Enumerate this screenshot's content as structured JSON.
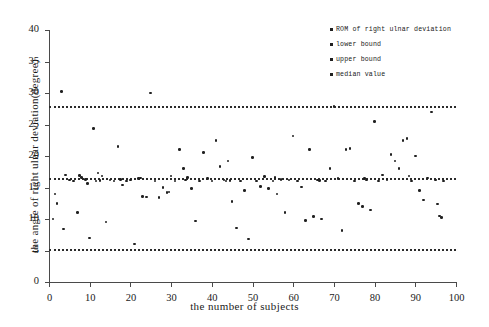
{
  "chart_data": {
    "type": "scatter",
    "title": "",
    "xlabel": "the number of subjects",
    "ylabel": "the angle of right ulnar deviation(degree)",
    "xlim": [
      0,
      100
    ],
    "ylim": [
      0,
      40
    ],
    "xticks": [
      0,
      10,
      20,
      30,
      40,
      50,
      60,
      70,
      80,
      90,
      100
    ],
    "yticks": [
      0,
      5,
      10,
      15,
      20,
      25,
      30,
      35,
      40
    ],
    "grid": false,
    "legend_position": "top-right",
    "legend": [
      {
        "label": "ROM of right ulnar deviation",
        "marker": "dot"
      },
      {
        "label": "lower bound",
        "marker": "dot"
      },
      {
        "label": "upper bound",
        "marker": "dot"
      },
      {
        "label": "median value",
        "marker": "dot"
      }
    ],
    "reference_lines": [
      {
        "name": "upper bound",
        "value": 28.0,
        "style": "dotted"
      },
      {
        "name": "median value",
        "value": 16.5,
        "style": "dotted"
      },
      {
        "name": "lower bound",
        "value": 5.2,
        "style": "dotted"
      }
    ],
    "series": [
      {
        "name": "ROM of right ulnar deviation",
        "marker": "dot",
        "color": "#202020",
        "points": [
          [
            1,
            10.0
          ],
          [
            1.5,
            14.0
          ],
          [
            2,
            12.5
          ],
          [
            3,
            30.2
          ],
          [
            3.5,
            8.4
          ],
          [
            4,
            17.0
          ],
          [
            5,
            16.2
          ],
          [
            6,
            16.0
          ],
          [
            7,
            11.0
          ],
          [
            8,
            16.6
          ],
          [
            9,
            16.3
          ],
          [
            9.5,
            15.6
          ],
          [
            10,
            7.0
          ],
          [
            11,
            24.4
          ],
          [
            11.5,
            16.0
          ],
          [
            12,
            17.3
          ],
          [
            13,
            16.8
          ],
          [
            14,
            9.5
          ],
          [
            15,
            16.2
          ],
          [
            16,
            16.0
          ],
          [
            17,
            21.5
          ],
          [
            17.5,
            16.3
          ],
          [
            18,
            15.4
          ],
          [
            19,
            16.0
          ],
          [
            20,
            16.2
          ],
          [
            21,
            6.0
          ],
          [
            22,
            16.4
          ],
          [
            23,
            13.6
          ],
          [
            24,
            13.5
          ],
          [
            25,
            30.0
          ],
          [
            26,
            16.0
          ],
          [
            27,
            13.4
          ],
          [
            28,
            15.0
          ],
          [
            29,
            14.2
          ],
          [
            29.5,
            14.3
          ],
          [
            30,
            16.8
          ],
          [
            31,
            16.0
          ],
          [
            32,
            21.0
          ],
          [
            33,
            18.0
          ],
          [
            34,
            16.6
          ],
          [
            35,
            14.8
          ],
          [
            36,
            9.7
          ],
          [
            37,
            16.0
          ],
          [
            38,
            20.6
          ],
          [
            39,
            16.4
          ],
          [
            40,
            16.0
          ],
          [
            41,
            22.5
          ],
          [
            42,
            18.3
          ],
          [
            43,
            16.2
          ],
          [
            43.5,
            16.0
          ],
          [
            44,
            19.2
          ],
          [
            45,
            12.8
          ],
          [
            46,
            8.6
          ],
          [
            47,
            16.0
          ],
          [
            48,
            14.5
          ],
          [
            49,
            6.8
          ],
          [
            50,
            19.8
          ],
          [
            51,
            16.0
          ],
          [
            52,
            15.2
          ],
          [
            53,
            16.7
          ],
          [
            54,
            14.8
          ],
          [
            55,
            16.0
          ],
          [
            56,
            14.0
          ],
          [
            57,
            16.3
          ],
          [
            58,
            11.0
          ],
          [
            59,
            16.2
          ],
          [
            60,
            23.2
          ],
          [
            61,
            16.0
          ],
          [
            62,
            15.1
          ],
          [
            63,
            9.8
          ],
          [
            64,
            21.0
          ],
          [
            65,
            10.4
          ],
          [
            66,
            16.2
          ],
          [
            67,
            10.0
          ],
          [
            68,
            16.0
          ],
          [
            69,
            18.0
          ],
          [
            70,
            27.9
          ],
          [
            71,
            16.4
          ],
          [
            72,
            8.2
          ],
          [
            73,
            21.0
          ],
          [
            74,
            21.2
          ],
          [
            75,
            16.0
          ],
          [
            76,
            12.5
          ],
          [
            77,
            12.0
          ],
          [
            78,
            16.2
          ],
          [
            79,
            11.4
          ],
          [
            80,
            25.5
          ],
          [
            81,
            16.0
          ],
          [
            82,
            17.0
          ],
          [
            83,
            16.3
          ],
          [
            84,
            20.2
          ],
          [
            85,
            19.2
          ],
          [
            86,
            18.0
          ],
          [
            87,
            22.5
          ],
          [
            88,
            22.8
          ],
          [
            89,
            16.0
          ],
          [
            90,
            20.0
          ],
          [
            91,
            14.5
          ],
          [
            92,
            13.0
          ],
          [
            93,
            16.5
          ],
          [
            94,
            27.0
          ],
          [
            95,
            16.2
          ],
          [
            95.5,
            12.4
          ],
          [
            96,
            10.5
          ],
          [
            96.5,
            10.2
          ],
          [
            97,
            16.0
          ],
          [
            7.5,
            16.9
          ],
          [
            12.5,
            16.1
          ],
          [
            22.5,
            16.5
          ],
          [
            33.5,
            16.2
          ],
          [
            55.5,
            16.6
          ],
          [
            66.5,
            16.1
          ],
          [
            77.5,
            16.4
          ],
          [
            88.5,
            16.8
          ],
          [
            44.5,
            16.1
          ]
        ]
      }
    ]
  }
}
